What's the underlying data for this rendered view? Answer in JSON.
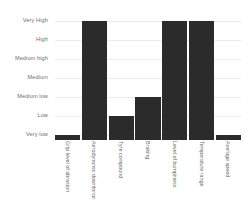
{
  "chart_data": {
    "type": "bar",
    "title": "",
    "subtitle": "",
    "xlabel": "",
    "ylabel": "",
    "categories": [
      "Grip level of abrasion",
      "Aerodynamic downforce",
      "Tyre compound",
      "Braking",
      "Level of bumpiness",
      "Temperature range",
      "Average speed"
    ],
    "values": [
      1,
      7,
      2,
      3,
      7,
      7,
      1
    ],
    "value_labels": [
      "Very low",
      "Very High",
      "Low",
      "Medium low",
      "Very High",
      "Very High",
      "Very low"
    ],
    "ytick_labels": [
      "Very High",
      "High",
      "Medium high",
      "Medium",
      "Medium low",
      "Low",
      "Very low"
    ],
    "ylim": [
      0,
      7
    ],
    "scale_levels": [
      "Very low",
      "Low",
      "Medium low",
      "Medium",
      "Medium high",
      "High",
      "Very High"
    ],
    "grid": true,
    "legend": "none",
    "colors": {
      "bar": "#2b2b2b",
      "background": "#ffffff",
      "gridline": "#ebebeb",
      "tick_text": "#6d6d6d"
    }
  }
}
